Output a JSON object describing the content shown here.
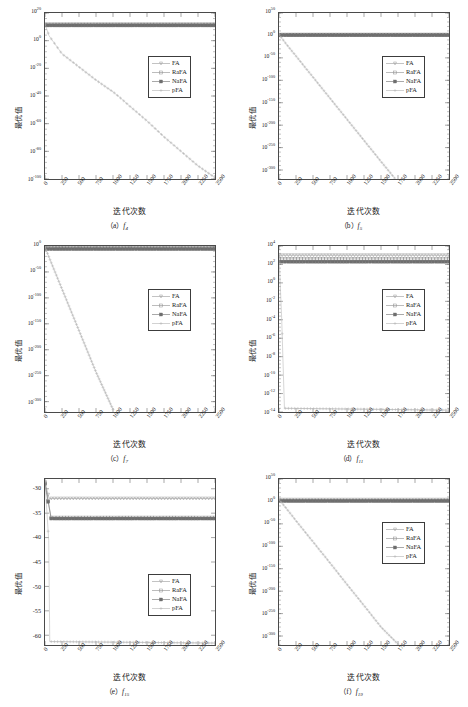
{
  "figure": {
    "panel_count": 6,
    "shared": {
      "xlabel": "迭代次数",
      "ylabel": "最优值",
      "xticks": [
        "0",
        "250",
        "500",
        "750",
        "1000",
        "1250",
        "1500",
        "1750",
        "2000",
        "2250",
        "2500"
      ],
      "xlim": [
        0,
        2500
      ],
      "legend": [
        {
          "label": "FA",
          "marker": "triangle-down",
          "color": "#9b9b9b"
        },
        {
          "label": "RaFA",
          "marker": "square",
          "color": "#8f8f8f"
        },
        {
          "label": "NaFA",
          "marker": "square-filled",
          "color": "#6e6e6e"
        },
        {
          "label": "pFA",
          "marker": "plus",
          "color": "#b4b4b4"
        }
      ]
    },
    "panels": [
      {
        "id": "a",
        "caption_prefix": "（a）",
        "func": "f",
        "func_sub": "4",
        "legend_pos": {
          "left": 104,
          "top": 44
        },
        "chart_data": {
          "type": "line",
          "title": "(a) f4",
          "xlabel": "迭代次数",
          "ylabel": "最优值",
          "xlim": [
            0,
            2500
          ],
          "ylim_exp": [
            -100,
            20
          ],
          "yscale": "log",
          "yticks": [
            "10^20",
            "10^0",
            "10^-20",
            "10^-40",
            "10^-60",
            "10^-80",
            "10^-100"
          ],
          "ytick_exps": [
            20,
            0,
            -20,
            -40,
            -60,
            -80,
            -100
          ],
          "grid": false,
          "legend_position": "center-right",
          "series": [
            {
              "name": "FA",
              "x": [
                0,
                2500
              ],
              "y_exp": [
                12.0,
                12.0
              ]
            },
            {
              "name": "RaFA",
              "x": [
                0,
                2500
              ],
              "y_exp": [
                11.4,
                11.4
              ]
            },
            {
              "name": "NaFA",
              "x": [
                0,
                2500
              ],
              "y_exp": [
                11.0,
                11.0
              ]
            },
            {
              "name": "pFA",
              "x": [
                0,
                60,
                250,
                500,
                750,
                1000,
                1100,
                1250,
                1500,
                1750,
                2000,
                2250,
                2500
              ],
              "y_exp": [
                12,
                3.5,
                -9.5,
                -19,
                -28.5,
                -37,
                -41,
                -47.5,
                -58,
                -69.5,
                -80,
                -90.5,
                -99
              ]
            }
          ]
        }
      },
      {
        "id": "b",
        "caption_prefix": "（b）",
        "func": "f",
        "func_sub": "5",
        "legend_pos": {
          "left": 104,
          "top": 44
        },
        "chart_data": {
          "type": "line",
          "title": "(b) f5",
          "xlabel": "迭代次数",
          "ylabel": "最优值",
          "xlim": [
            0,
            2500
          ],
          "ylim_exp": [
            -320,
            50
          ],
          "yscale": "log",
          "yticks": [
            "10^50",
            "10^0",
            "10^-50",
            "10^-100",
            "10^-150",
            "10^-200",
            "10^-250",
            "10^-300"
          ],
          "ytick_exps": [
            50,
            0,
            -50,
            -100,
            -150,
            -200,
            -250,
            -300
          ],
          "grid": false,
          "legend_position": "center-right",
          "series": [
            {
              "name": "FA",
              "x": [
                0,
                2500
              ],
              "y_exp": [
                2.0,
                2.0
              ]
            },
            {
              "name": "RaFA",
              "x": [
                0,
                2500
              ],
              "y_exp": [
                1.0,
                1.0
              ]
            },
            {
              "name": "NaFA",
              "x": [
                0,
                2500
              ],
              "y_exp": [
                0.4,
                0.4
              ]
            },
            {
              "name": "pFA",
              "x": [
                0,
                100,
                250,
                500,
                750,
                1000,
                1250,
                1500,
                1700
              ],
              "y_exp": [
                2,
                -18,
                -46,
                -93,
                -140,
                -187,
                -234,
                -281,
                -318
              ]
            }
          ]
        }
      },
      {
        "id": "c",
        "caption_prefix": "（c）",
        "func": "f",
        "func_sub": "7",
        "legend_pos": {
          "left": 104,
          "top": 44
        },
        "chart_data": {
          "type": "line",
          "title": "(c) f7",
          "xlabel": "迭代次数",
          "ylabel": "最优值",
          "xlim": [
            0,
            2500
          ],
          "ylim_exp": [
            -320,
            0
          ],
          "yscale": "log",
          "yticks": [
            "10^0",
            "10^-50",
            "10^-100",
            "10^-150",
            "10^-200",
            "10^-250",
            "10^-300"
          ],
          "ytick_exps": [
            0,
            -50,
            -100,
            -150,
            -200,
            -250,
            -300
          ],
          "grid": false,
          "legend_position": "center-right",
          "series": [
            {
              "name": "FA",
              "x": [
                0,
                2500
              ],
              "y_exp": [
                -2.0,
                -2.0
              ]
            },
            {
              "name": "RaFA",
              "x": [
                0,
                2500
              ],
              "y_exp": [
                -4.0,
                -4.0
              ]
            },
            {
              "name": "NaFA",
              "x": [
                0,
                2500
              ],
              "y_exp": [
                -6.0,
                -6.0
              ]
            },
            {
              "name": "pFA",
              "x": [
                0,
                60,
                250,
                500,
                750,
                1000
              ],
              "y_exp": [
                -2,
                -22,
                -83,
                -163,
                -243,
                -315
              ]
            }
          ]
        }
      },
      {
        "id": "d",
        "caption_prefix": "（d）",
        "func": "f",
        "func_sub": "11",
        "legend_pos": {
          "left": 104,
          "top": 44
        },
        "chart_data": {
          "type": "line",
          "title": "(d) f11",
          "xlabel": "迭代次数",
          "ylabel": "最优值",
          "xlim": [
            0,
            2500
          ],
          "ylim_exp": [
            -14,
            4
          ],
          "yscale": "log",
          "yticks": [
            "10^4",
            "10^2",
            "10^0",
            "10^-2",
            "10^-4",
            "10^-6",
            "10^-8",
            "10^-10",
            "10^-12",
            "10^-14"
          ],
          "ytick_exps": [
            4,
            2,
            0,
            -2,
            -4,
            -6,
            -8,
            -10,
            -12,
            -14
          ],
          "grid": false,
          "legend_position": "center-right",
          "series": [
            {
              "name": "FA",
              "x": [
                0,
                2500
              ],
              "y_exp": [
                3.0,
                3.0
              ]
            },
            {
              "name": "RaFA",
              "x": [
                0,
                2500
              ],
              "y_exp": [
                2.6,
                2.6
              ]
            },
            {
              "name": "NaFA",
              "x": [
                0,
                2500
              ],
              "y_exp": [
                2.3,
                2.3
              ]
            },
            {
              "name": "pFA",
              "x": [
                0,
                40,
                80,
                2500
              ],
              "y_exp": [
                3,
                -4,
                -13.6,
                -13.8
              ]
            }
          ]
        }
      },
      {
        "id": "e",
        "caption_prefix": "（e）",
        "func": "f",
        "func_sub": "15",
        "legend_pos": {
          "left": 104,
          "top": 96
        },
        "chart_data": {
          "type": "line",
          "title": "(e) f15",
          "xlabel": "迭代次数",
          "ylabel": "最优值",
          "xlim": [
            0,
            2500
          ],
          "ylim": [
            -62,
            -28
          ],
          "yscale": "linear",
          "yticks": [
            "-30",
            "-35",
            "-40",
            "-45",
            "-50",
            "-55",
            "-60"
          ],
          "ytick_vals": [
            -30,
            -35,
            -40,
            -45,
            -50,
            -55,
            -60
          ],
          "grid": false,
          "legend_position": "center-right",
          "series": [
            {
              "name": "FA",
              "x": [
                0,
                60,
                2500
              ],
              "y": [
                -28.6,
                -32.0,
                -32.0
              ]
            },
            {
              "name": "RaFA",
              "x": [
                0,
                90,
                2500
              ],
              "y": [
                -28.8,
                -35.9,
                -35.9
              ]
            },
            {
              "name": "NaFA",
              "x": [
                0,
                90,
                2500
              ],
              "y": [
                -29.0,
                -36.1,
                -36.1
              ]
            },
            {
              "name": "pFA",
              "x": [
                0,
                55,
                70,
                2500
              ],
              "y": [
                -28.6,
                -40.6,
                -61.3,
                -61.6
              ]
            }
          ]
        }
      },
      {
        "id": "f",
        "caption_prefix": "（f）",
        "func": "f",
        "func_sub": "19",
        "legend_pos": {
          "left": 104,
          "top": 44
        },
        "chart_data": {
          "type": "line",
          "title": "(f) f19",
          "xlabel": "迭代次数",
          "ylabel": "最优值",
          "xlim": [
            0,
            2500
          ],
          "ylim_exp": [
            -320,
            50
          ],
          "yscale": "log",
          "yticks": [
            "10^50",
            "10^0",
            "10^-50",
            "10^-100",
            "10^-150",
            "10^-200",
            "10^-250",
            "10^-300"
          ],
          "ytick_exps": [
            50,
            0,
            -50,
            -100,
            -150,
            -200,
            -250,
            -300
          ],
          "grid": false,
          "legend_position": "center-right",
          "series": [
            {
              "name": "FA",
              "x": [
                0,
                2500
              ],
              "y_exp": [
                4.0,
                4.0
              ]
            },
            {
              "name": "RaFA",
              "x": [
                0,
                2500
              ],
              "y_exp": [
                2.0,
                2.0
              ]
            },
            {
              "name": "NaFA",
              "x": [
                0,
                2500
              ],
              "y_exp": [
                1.0,
                1.0
              ]
            },
            {
              "name": "pFA",
              "x": [
                0,
                100,
                250,
                500,
                750,
                1000,
                1250,
                1500,
                1750
              ],
              "y_exp": [
                4,
                -14,
                -43,
                -90,
                -137,
                -185,
                -232,
                -280,
                -318
              ]
            }
          ]
        }
      }
    ]
  }
}
